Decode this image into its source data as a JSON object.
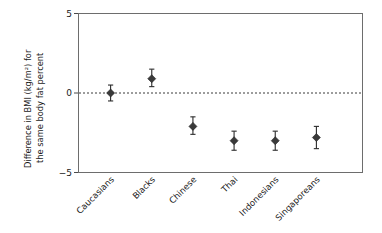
{
  "chart_data": {
    "type": "scatter",
    "title": "",
    "xlabel": "",
    "ylabel": "Difference in BMI (kg/m²) for\nthe same body fat percent",
    "ylabel_line1": "Difference in BMI (kg/m²) for",
    "ylabel_line2": "the same body fat percent",
    "categories": [
      "Caucasians",
      "Blacks",
      "Chinese",
      "Thai",
      "Indonesians",
      "Singaporeans"
    ],
    "values": [
      0.0,
      0.9,
      -2.1,
      -3.0,
      -3.0,
      -2.8
    ],
    "err_low": [
      -0.5,
      0.4,
      -2.6,
      -3.6,
      -3.6,
      -3.5
    ],
    "err_high": [
      0.5,
      1.5,
      -1.5,
      -2.4,
      -2.4,
      -2.1
    ],
    "ylim": [
      -5,
      5
    ],
    "yticks": [
      5,
      0,
      -5
    ],
    "ytick_labels": [
      "5",
      "0",
      "−5"
    ],
    "grid": false,
    "legend": "none",
    "zero_reference_line": true,
    "marker_shape": "diamond",
    "marker_color": "#3a3a3a",
    "frame_color": "#6d6d6d",
    "error_bar_color": "#2b2b2b",
    "x_label_rotation_deg": -45,
    "points": [
      {
        "category": "Caucasians",
        "value": 0.0,
        "low": -0.5,
        "high": 0.5
      },
      {
        "category": "Blacks",
        "value": 0.9,
        "low": 0.4,
        "high": 1.5
      },
      {
        "category": "Chinese",
        "value": -2.1,
        "low": -2.6,
        "high": -1.5
      },
      {
        "category": "Thai",
        "value": -3.0,
        "low": -3.6,
        "high": -2.4
      },
      {
        "category": "Indonesians",
        "value": -3.0,
        "low": -3.6,
        "high": -2.4
      },
      {
        "category": "Singaporeans",
        "value": -2.8,
        "low": -3.5,
        "high": -2.1
      }
    ]
  }
}
